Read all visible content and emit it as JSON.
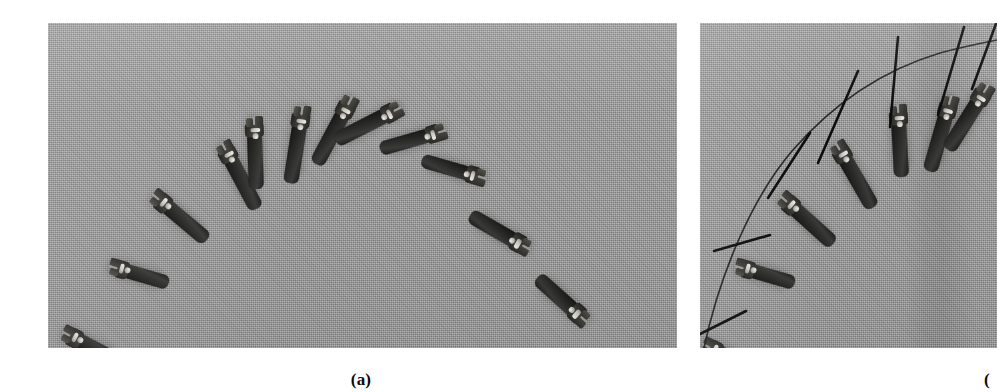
{
  "figure": {
    "kind": "two-panel photographic figure",
    "background_color": "#ffffff",
    "panels": [
      {
        "id": "a",
        "caption": "(a)",
        "x": 48,
        "y": 23,
        "width": 629,
        "height": 325,
        "surface_color": "#9b9b9b",
        "surface_description": "gray woven fabric / canvas backdrop",
        "content": "twelve dark adjustable wrenches laid out in an arc",
        "overlay": "none",
        "objects": [
          {
            "name": "wrench-01",
            "cx": 47,
            "cy": 279,
            "angle": 118,
            "length": 78,
            "width": 17,
            "head": "bottom-right"
          },
          {
            "name": "wrench-02",
            "cx": 90,
            "cy": 213,
            "angle": 108,
            "length": 74,
            "width": 16,
            "head": "right"
          },
          {
            "name": "wrench-03",
            "cx": 134,
            "cy": 141,
            "angle": 130,
            "length": 86,
            "width": 17,
            "head": "bottom-right"
          },
          {
            "name": "wrench-04",
            "cx": 199,
            "cy": 95,
            "angle": 152,
            "length": 92,
            "width": 17,
            "head": "top-right"
          },
          {
            "name": "wrench-05",
            "cx": 226,
            "cy": 62,
            "angle": 176,
            "length": 88,
            "width": 17,
            "head": "top"
          },
          {
            "name": "wrench-06",
            "cx": 273,
            "cy": 48,
            "angle": 188,
            "length": 96,
            "width": 17,
            "head": "top"
          },
          {
            "name": "wrench-07",
            "cx": 320,
            "cy": 35,
            "angle": 208,
            "length": 94,
            "width": 17,
            "head": "top-left"
          },
          {
            "name": "wrench-08",
            "cx": 372,
            "cy": 48,
            "angle": 242,
            "length": 92,
            "width": 17,
            "head": "left"
          },
          {
            "name": "wrench-09",
            "cx": 416,
            "cy": 74,
            "angle": 252,
            "length": 86,
            "width": 16,
            "head": "left"
          },
          {
            "name": "wrench-10",
            "cx": 455,
            "cy": 126,
            "angle": 284,
            "length": 82,
            "width": 16,
            "head": "bottom-left"
          },
          {
            "name": "wrench-11",
            "cx": 497,
            "cy": 196,
            "angle": 300,
            "length": 80,
            "width": 17,
            "head": "bottom"
          },
          {
            "name": "wrench-12",
            "cx": 556,
            "cy": 268,
            "angle": 312,
            "length": 78,
            "width": 17,
            "head": "bottom-right"
          }
        ]
      },
      {
        "id": "b",
        "caption": "(",
        "caption_clipped": true,
        "x": 700,
        "y": 23,
        "width": 297,
        "height": 325,
        "surface_color": "#9b9b9b",
        "surface_description": "gray woven fabric / canvas backdrop with vertical seam shading",
        "content": "right portion of the same wrench arrangement with fitted orientation axes and a smooth curve traced through the object centers",
        "overlay": "black straight axis line per wrench plus one thin curve through the arc",
        "objects": [
          {
            "name": "wrench-b1",
            "cx": 18,
            "cy": 290,
            "angle": 118,
            "length": 78,
            "width": 17,
            "axis_angle": 118
          },
          {
            "name": "wrench-b2",
            "cx": 62,
            "cy": 213,
            "angle": 108,
            "length": 74,
            "width": 16,
            "axis_angle": 108
          },
          {
            "name": "wrench-b3",
            "cx": 108,
            "cy": 143,
            "angle": 132,
            "length": 86,
            "width": 17,
            "axis_angle": 132
          },
          {
            "name": "wrench-b4",
            "cx": 160,
            "cy": 92,
            "angle": 150,
            "length": 90,
            "width": 17,
            "axis_angle": 150
          },
          {
            "name": "wrench-b5",
            "cx": 218,
            "cy": 52,
            "angle": 176,
            "length": 88,
            "width": 17,
            "axis_angle": 176
          },
          {
            "name": "wrench-b6",
            "cx": 268,
            "cy": 40,
            "angle": 196,
            "length": 92,
            "width": 17,
            "axis_angle": 196
          },
          {
            "name": "wrench-b7",
            "cx": 296,
            "cy": 30,
            "angle": 210,
            "length": 86,
            "width": 17,
            "axis_angle": 210
          }
        ],
        "curve": {
          "color": "#1a1a1a",
          "width": 1.6,
          "description": "thin arc passing through the wrench centers from lower-left to upper-right"
        }
      }
    ]
  }
}
